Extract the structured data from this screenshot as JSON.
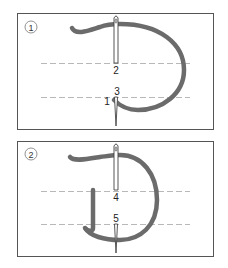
{
  "figure": {
    "type": "embroidery-stitch-diagram",
    "panels": [
      {
        "step": "1",
        "point_labels": [
          "1",
          "2",
          "3"
        ],
        "guide_lines": 2
      },
      {
        "step": "2",
        "point_labels": [
          "4",
          "5"
        ],
        "guide_lines": 2
      }
    ]
  },
  "colors": {
    "thread": "#6b6b6b",
    "border": "#555555",
    "guide_line": "#b0b0b0",
    "needle": "#444444",
    "background": "#ffffff"
  }
}
